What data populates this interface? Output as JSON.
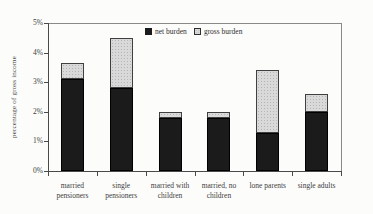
{
  "figure": {
    "y_axis_title": "percentage of gross income"
  },
  "legend": {
    "items": [
      {
        "label": "net burden",
        "swatch": "black-solid-square"
      },
      {
        "label": "gross burden",
        "swatch": "gray-dotted-square"
      }
    ]
  },
  "chart_data": {
    "type": "bar",
    "stacked": true,
    "title": "",
    "categories": [
      "married pensioners",
      "single pensioners",
      "married with children",
      "married, no children",
      "lone parents",
      "single adults"
    ],
    "series": [
      {
        "name": "net burden",
        "values": [
          3.1,
          2.8,
          1.8,
          1.8,
          1.3,
          2.0
        ]
      },
      {
        "name": "gross burden",
        "values": [
          3.65,
          4.5,
          2.0,
          2.0,
          3.4,
          2.6
        ]
      }
    ],
    "series_note": "gross burden values are bar totals; gray segment is drawn from net value up to gross total",
    "xlabel": "",
    "ylabel": "percentage of gross income",
    "ylim": [
      0,
      5
    ],
    "ytick_labels": [
      "0%",
      "1%",
      "2%",
      "3%",
      "4%",
      "5%"
    ],
    "legend_position": "top-center-inside",
    "grid": false,
    "colors": {
      "net": "#1b1b1b",
      "gross_fill": "#d9d9d9",
      "gross_dots": "#b5b5b5",
      "gross_border": "#3f3f3f",
      "axis": "#4a4a4a",
      "frame": "#8a8a8a",
      "text": "#3d3d3d"
    }
  }
}
